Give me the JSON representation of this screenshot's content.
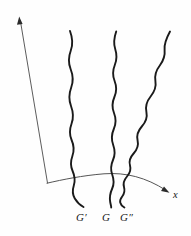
{
  "figure": {
    "background_color": "#fefefe",
    "width": 191,
    "height": 236,
    "axes": {
      "y_axis": {
        "name": "vertical-axis",
        "label": "",
        "arrow_direction": "up-left",
        "stroke_color": "#4a4a4a",
        "start": [
          47,
          183
        ],
        "end": [
          19,
          18
        ]
      },
      "x_axis": {
        "name": "horizontal-axis",
        "label": "x",
        "arrow_direction": "down-right",
        "stroke_color": "#555555",
        "start": [
          47,
          183
        ],
        "end": [
          168,
          193
        ]
      }
    },
    "baseline": {
      "name": "curved-baseline",
      "description": "arc rising from origin then descending to the x arrow",
      "stroke_color": "#555555"
    },
    "curves": [
      {
        "id": "curve-g-prime",
        "label": "G′",
        "label_position": [
          76,
          211
        ],
        "stroke_color": "#1a1a1a",
        "top_x": 70,
        "bottom_x": 84
      },
      {
        "id": "curve-g",
        "label": "G",
        "label_position": [
          102,
          211
        ],
        "stroke_color": "#1a1a1a",
        "top_x": 116,
        "bottom_x": 106
      },
      {
        "id": "curve-g-double-prime",
        "label": "G″",
        "label_position": [
          120,
          211
        ],
        "stroke_color": "#1a1a1a",
        "top_x": 170,
        "bottom_x": 125
      }
    ],
    "labels": {
      "x_axis_label": "x",
      "g_prime": "G′",
      "g": "G",
      "g_double_prime": "G″"
    }
  }
}
